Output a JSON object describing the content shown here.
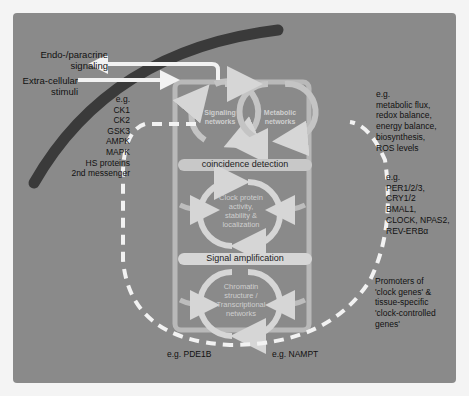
{
  "diagram": {
    "left_inputs": {
      "endo_paracrine": "Endo-/paracrine\nsignaling",
      "extra_cellular": "Extra-cellular\nstimuli"
    },
    "kinase_examples": {
      "prefix": "e.g.",
      "items": [
        "CK1",
        "CK2",
        "GSK3",
        "AMPK",
        "MAPK",
        "HS proteins",
        "2nd messenger"
      ]
    },
    "modules": {
      "signaling": "Signaling\nnetworks",
      "metabolic": "Metabolic\nnetworks",
      "clock_protein": "Clock protein\nactivity,\nstability &\nlocalization",
      "chromatin": "Chromatin\nstructure /\nTranscriptional\nnetworks"
    },
    "bars": {
      "coincidence": "coincidence detection",
      "amplification": "Signal amplification"
    },
    "right_annotations": {
      "metabolic": "e.g.\nmetabolic flux,\nredox balance,\nenergy balance,\nbiosynthesis,\nROS levels",
      "clock_genes": "e.g.\nPER1/2/3,\nCRY1/2\nBMAL1,\nCLOCK, NPAS2,\nREV-ERBα",
      "promoters": "Promoters of\n'clock genes' &\ntissue-specific\n'clock-controlled\ngenes'"
    },
    "bottom_examples": {
      "left": "e.g. PDE1B",
      "right": "e.g. NAMPT"
    },
    "colors": {
      "panel": "#8a8a8a",
      "membrane": "#3a3a3a",
      "arrow_light": "#d6d6d6",
      "arrow_white": "#f2f2f2",
      "bar": "#c8c8c8"
    }
  }
}
